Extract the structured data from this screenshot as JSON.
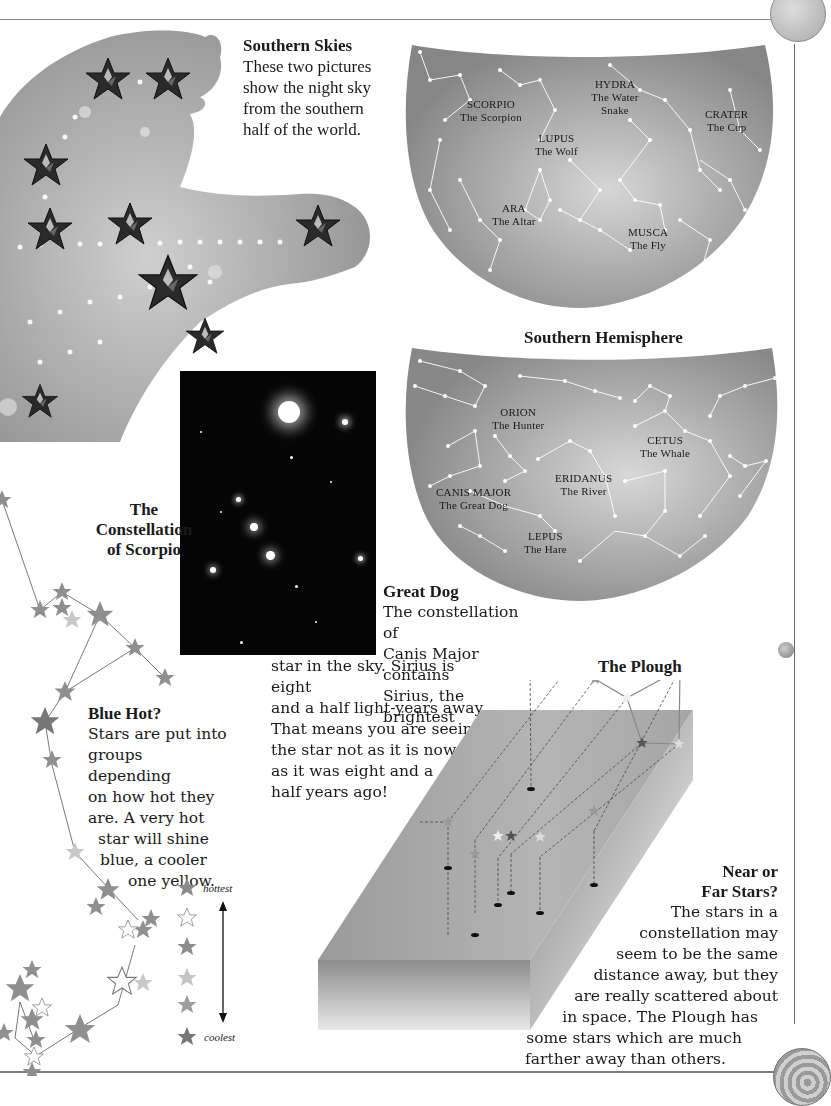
{
  "page": {
    "corner_icons": [
      "globe-icon-top",
      "shell-icon-bottom"
    ]
  },
  "southern_skies": {
    "heading": "Southern Skies",
    "lines": [
      "These two pictures",
      "show the night sky",
      "from the southern",
      "half of the world."
    ]
  },
  "sky_map_1": {
    "labels": [
      {
        "name": "SCORPIO",
        "sub": "The Scorpion"
      },
      {
        "name": "HYDRA",
        "sub": "The Water Snake"
      },
      {
        "name": "CRATER",
        "sub": "The Cup"
      },
      {
        "name": "LUPUS",
        "sub": "The Wolf"
      },
      {
        "name": "ARA",
        "sub": "The Altar"
      },
      {
        "name": "MUSCA",
        "sub": "The Fly"
      }
    ]
  },
  "sky_map_2": {
    "title": "Southern Hemisphere",
    "labels": [
      {
        "name": "ORION",
        "sub": "The Hunter"
      },
      {
        "name": "CETUS",
        "sub": "The Whale"
      },
      {
        "name": "ERIDANUS",
        "sub": "The River"
      },
      {
        "name": "CANIS MAJOR",
        "sub": "The Great Dog"
      },
      {
        "name": "LEPUS",
        "sub": "The Hare"
      }
    ]
  },
  "scorpio": {
    "heading_lines": [
      "The",
      "Constellation",
      "of Scorpio"
    ]
  },
  "blue_hot": {
    "heading": "Blue Hot?",
    "lines": [
      "Stars are put into",
      "groups depending",
      "on how hot they",
      "are. A very hot",
      "star will shine",
      "blue, a cooler",
      "one yellow."
    ]
  },
  "legend": {
    "top_label": "hottest",
    "bottom_label": "coolest",
    "star_colors": [
      "#8a8a8a",
      "#ffffff",
      "#8c8c8c",
      "#c4c4c4",
      "#9e9e9e",
      "#777777"
    ]
  },
  "great_dog": {
    "heading": "Great Dog",
    "lines_narrow": [
      "The constellation of",
      "Canis Major contains",
      "Sirius, the brightest"
    ],
    "lines_wide": [
      "star in the sky. Sirius is eight",
      "and a half light-years away.",
      "That means you are seeing",
      "the star not as it is now but",
      "as it was eight and a",
      "half years ago!"
    ]
  },
  "plough": {
    "title": "The Plough"
  },
  "near_far": {
    "heading_lines": [
      "Near or",
      "Far Stars?"
    ],
    "lines": [
      "The stars in a",
      "constellation may",
      "seem to be the same",
      "distance away, but they",
      "are really scattered about",
      "in space. The Plough has",
      "some stars which are much",
      "farther away than others."
    ]
  }
}
